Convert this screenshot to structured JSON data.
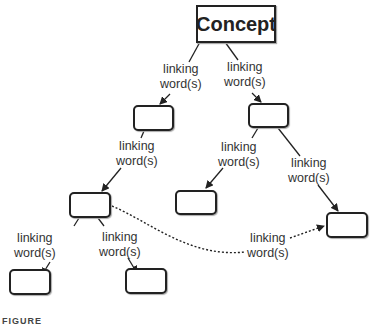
{
  "diagram": {
    "concept": "Concept",
    "link_text_line1": "linking",
    "link_text_line2": "word(s)",
    "links": [
      {
        "id": "concept-left",
        "l1": "linking",
        "l2": "word(s)"
      },
      {
        "id": "concept-right",
        "l1": "linking",
        "l2": "word(s)"
      },
      {
        "id": "l1-l2",
        "l1": "linking",
        "l2": "word(s)"
      },
      {
        "id": "r1-r2a",
        "l1": "linking",
        "l2": "word(s)"
      },
      {
        "id": "r1-r2b",
        "l1": "linking",
        "l2": "word(s)"
      },
      {
        "id": "l2-l3a",
        "l1": "linking",
        "l2": "word(s)"
      },
      {
        "id": "l2-l3b",
        "l1": "linking",
        "l2": "word(s)"
      },
      {
        "id": "crosslink",
        "l1": "linking",
        "l2": "word(s)"
      }
    ],
    "caption": "FIGURE"
  }
}
